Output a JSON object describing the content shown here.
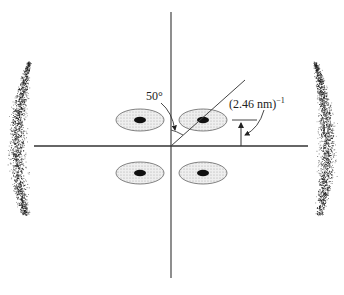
{
  "diagram": {
    "type": "diffraction-pattern",
    "labels": {
      "angle": "50°",
      "spacing": "(2.46 nm)",
      "spacing_exponent": "−1"
    },
    "axes": {
      "origin": [
        171,
        146
      ],
      "vertical": {
        "x": 171,
        "y1": 12,
        "y2": 278
      },
      "horizontal": {
        "y": 146,
        "x1": 34,
        "x2": 308
      }
    },
    "tilt_line": {
      "from": [
        171,
        146
      ],
      "to": [
        245,
        80
      ],
      "angle_from_vertical_deg": 50
    },
    "reflections": [
      {
        "id": "upper-left",
        "cx": 140,
        "cy": 120
      },
      {
        "id": "upper-right",
        "cx": 203,
        "cy": 120
      },
      {
        "id": "lower-left",
        "cx": 140,
        "cy": 173
      },
      {
        "id": "lower-right",
        "cx": 203,
        "cy": 173
      }
    ],
    "equatorial_arcs": [
      "left",
      "right"
    ],
    "colors": {
      "line": "#333333",
      "spot_fill": "#e2e2e2",
      "spot_core": "#111111",
      "arc_dots": "#222222"
    }
  }
}
